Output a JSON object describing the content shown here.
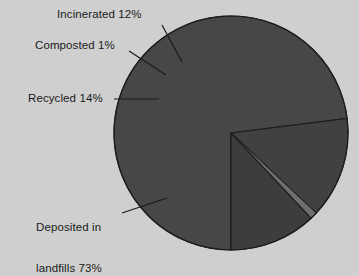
{
  "chart_data": {
    "type": "pie",
    "title": "",
    "subtitle": "",
    "xlabel": "",
    "ylabel": "",
    "legend_position": "none",
    "grid": false,
    "units": "percent",
    "total": 100,
    "categories": [
      "Deposited in landfills",
      "Recycled",
      "Composted",
      "Incinerated"
    ],
    "values": [
      73,
      14,
      1,
      12
    ],
    "slices": [
      {
        "name": "Deposited in landfills",
        "value": 73,
        "label": "Deposited in\nlandfills 73%",
        "label_line1": "Deposited in",
        "label_line2": "landfills 73%",
        "color": "#474747",
        "start_angle_deg": 180,
        "end_angle_deg": 442.8
      },
      {
        "name": "Recycled",
        "value": 14,
        "label": "Recycled 14%",
        "color": "#414141",
        "start_angle_deg": 442.8,
        "end_angle_deg": 493.2
      },
      {
        "name": "Composted",
        "value": 1,
        "label": "Composted 1%",
        "color": "#6e6e6e",
        "start_angle_deg": 493.2,
        "end_angle_deg": 496.8
      },
      {
        "name": "Incinerated",
        "value": 12,
        "label": "Incinerated 12%",
        "color": "#3d3d3d",
        "start_angle_deg": 496.8,
        "end_angle_deg": 540
      }
    ],
    "colors": {
      "background": "#cfcfcf",
      "slice_dark": "#474747",
      "slice_light": "#6e6e6e",
      "outline": "#1d1d1d",
      "leader_line": "#1a1a1a",
      "text": "#1a1a1a"
    },
    "geometry": {
      "center_x": 231,
      "center_y": 133,
      "radius": 117
    }
  },
  "labels": {
    "incinerated": "Incinerated 12%",
    "composted": "Composted 1%",
    "recycled": "Recycled 14%",
    "deposited_line1": "Deposited in",
    "deposited_line2": "landfills 73%"
  }
}
